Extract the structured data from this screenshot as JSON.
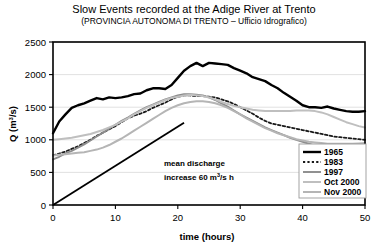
{
  "chart_data": {
    "type": "line",
    "title": "Slow Events recorded at the Adige River at Trento",
    "subtitle": "(PROVINCIA AUTONOMA DI TRENTO – Ufficio Idrografico)",
    "xlabel": "time (hours)",
    "ylabel_main": "Q (m",
    "ylabel_sup": "3",
    "ylabel_tail": "/s)",
    "xlim": [
      0,
      50
    ],
    "ylim": [
      0,
      2500
    ],
    "xticks": [
      0,
      10,
      20,
      30,
      40,
      50
    ],
    "yticks": [
      0,
      500,
      1000,
      1500,
      2000,
      2500
    ],
    "xtick_labels": [
      "0",
      "10",
      "20",
      "30",
      "40",
      "50"
    ],
    "ytick_labels": [
      "0",
      "500",
      "1000",
      "1500",
      "2000",
      "2500"
    ],
    "grid": "horizontal",
    "legend_position": "bottom-right",
    "x": [
      0,
      1,
      2,
      3,
      4,
      5,
      6,
      7,
      8,
      9,
      10,
      11,
      12,
      13,
      14,
      15,
      16,
      17,
      18,
      19,
      20,
      21,
      22,
      23,
      24,
      25,
      26,
      27,
      28,
      29,
      30,
      31,
      32,
      33,
      34,
      35,
      36,
      37,
      38,
      39,
      40,
      41,
      42,
      43,
      44,
      45,
      46,
      47,
      48,
      49,
      50
    ],
    "series": [
      {
        "name": "1965",
        "color": "#000000",
        "style": "solid",
        "width": 2.4,
        "values": [
          1100,
          1280,
          1390,
          1490,
          1530,
          1560,
          1600,
          1640,
          1620,
          1650,
          1640,
          1650,
          1670,
          1700,
          1710,
          1760,
          1790,
          1790,
          1780,
          1840,
          1950,
          2060,
          2130,
          2180,
          2130,
          2180,
          2170,
          2160,
          2150,
          2100,
          2060,
          2020,
          1960,
          1930,
          1900,
          1840,
          1790,
          1720,
          1660,
          1600,
          1530,
          1500,
          1500,
          1490,
          1510,
          1480,
          1460,
          1440,
          1430,
          1430,
          1440
        ]
      },
      {
        "name": "1983",
        "color": "#1a1a1a",
        "style": "dotted",
        "width": 1.8,
        "values": [
          760,
          790,
          820,
          860,
          900,
          950,
          1000,
          1060,
          1110,
          1160,
          1210,
          1270,
          1330,
          1370,
          1400,
          1440,
          1490,
          1530,
          1570,
          1620,
          1660,
          1680,
          1680,
          1670,
          1670,
          1660,
          1650,
          1620,
          1590,
          1550,
          1500,
          1450,
          1400,
          1340,
          1290,
          1250,
          1230,
          1210,
          1190,
          1170,
          1150,
          1130,
          1110,
          1090,
          1070,
          1050,
          1040,
          1030,
          1020,
          1010,
          1000
        ]
      },
      {
        "name": "1997",
        "color": "#8c8c8c",
        "style": "solid",
        "width": 1.9,
        "values": [
          700,
          740,
          790,
          830,
          880,
          930,
          990,
          1050,
          1110,
          1170,
          1230,
          1290,
          1340,
          1400,
          1450,
          1500,
          1540,
          1580,
          1620,
          1650,
          1680,
          1700,
          1700,
          1690,
          1680,
          1650,
          1610,
          1560,
          1510,
          1450,
          1390,
          1340,
          1290,
          1240,
          1190,
          1150,
          1110,
          1070,
          1030,
          1000,
          970,
          940,
          910,
          890,
          870,
          860,
          850,
          840,
          830,
          830,
          830
        ]
      },
      {
        "name": "Oct 2000",
        "color": "#bfbfbf",
        "style": "solid",
        "width": 2.0,
        "values": [
          1000,
          1010,
          1020,
          1030,
          1050,
          1070,
          1090,
          1120,
          1150,
          1190,
          1230,
          1280,
          1330,
          1390,
          1440,
          1490,
          1530,
          1570,
          1610,
          1640,
          1660,
          1680,
          1690,
          1680,
          1670,
          1650,
          1620,
          1580,
          1550,
          1520,
          1500,
          1480,
          1460,
          1450,
          1440,
          1440,
          1440,
          1440,
          1440,
          1450,
          1450,
          1450,
          1440,
          1420,
          1390,
          1350,
          1310,
          1270,
          1240,
          1210,
          1190
        ]
      },
      {
        "name": "Nov 2000",
        "color": "#b5b5b5",
        "style": "solid",
        "width": 2.0,
        "values": [
          760,
          770,
          780,
          790,
          800,
          810,
          830,
          850,
          880,
          920,
          970,
          1020,
          1080,
          1140,
          1200,
          1260,
          1320,
          1380,
          1440,
          1490,
          1530,
          1560,
          1580,
          1590,
          1590,
          1580,
          1560,
          1530,
          1490,
          1440,
          1390,
          1330,
          1280,
          1230,
          1180,
          1140,
          1100,
          1070,
          1040,
          1010,
          990,
          970,
          960,
          950,
          940,
          940,
          940,
          940,
          940,
          945,
          950
        ]
      }
    ],
    "annotations": [
      {
        "name": "mean-discharge",
        "line1": "mean discharge",
        "line2_prefix": "increase 60 m",
        "line2_sup": "3",
        "line2_suffix": "/s h",
        "trend_line": {
          "x0": 0,
          "y0": 0,
          "x1": 21,
          "y1": 1260,
          "slope": 60,
          "color": "#000000"
        }
      }
    ],
    "legend": {
      "entries": [
        "1965",
        "1983",
        "1997",
        "Oct 2000",
        "Nov 2000"
      ]
    }
  }
}
